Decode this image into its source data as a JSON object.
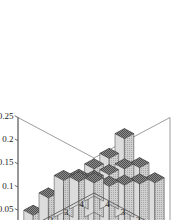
{
  "figure": {
    "background_color": "#ffffff",
    "axis_color": "#4a4a4a",
    "box_color": "#5a5a5a",
    "bar_top_color": "#6e6e6e",
    "bar_left_color": "#d8d8d8",
    "bar_right_color": "#bdbdbd",
    "bar_edge_color": "#2b2b2b"
  },
  "chart_data": {
    "type": "bar",
    "subtype": "bar3d",
    "title": "",
    "xlabel": "",
    "ylabel": "",
    "zlabel": "",
    "grid": false,
    "legend": false,
    "x_categories": [
      "0",
      "1",
      "2",
      "3",
      "4"
    ],
    "y_categories": [
      "0",
      "1",
      "2",
      "3",
      "4"
    ],
    "x_tick_labels": [
      "0",
      "1",
      "2",
      "3",
      "4"
    ],
    "y_tick_labels": [
      "0",
      "1",
      "2",
      "3",
      "4"
    ],
    "z_tick_labels": [
      "0",
      "0.05",
      "0.1",
      "0.15",
      "0.2",
      "0.25"
    ],
    "z_tick_values": [
      0,
      0.05,
      0.1,
      0.15,
      0.2,
      0.25
    ],
    "zlim": [
      0,
      0.25
    ],
    "xlim": [
      0,
      4
    ],
    "ylim": [
      0,
      4
    ],
    "rows_note": "values[row][col] with row = y index 0..4 (back to front), col = x index 0..4 (left to right)",
    "values": [
      [
        0.12,
        0.17,
        0.25,
        0.17,
        0.12
      ],
      [
        0.1,
        0.15,
        0.19,
        0.15,
        0.1
      ],
      [
        0.08,
        0.12,
        0.15,
        0.12,
        0.08
      ],
      [
        0.06,
        0.09,
        0.11,
        0.09,
        0.06
      ],
      [
        0.05,
        0.07,
        0.09,
        0.07,
        0.05
      ]
    ],
    "series": [
      {
        "name": "row-0",
        "values": [
          0.12,
          0.17,
          0.25,
          0.17,
          0.12
        ]
      },
      {
        "name": "row-1",
        "values": [
          0.1,
          0.15,
          0.19,
          0.15,
          0.1
        ]
      },
      {
        "name": "row-2",
        "values": [
          0.08,
          0.12,
          0.15,
          0.12,
          0.08
        ]
      },
      {
        "name": "row-3",
        "values": [
          0.06,
          0.09,
          0.11,
          0.09,
          0.06
        ]
      },
      {
        "name": "row-4",
        "values": [
          0.05,
          0.07,
          0.09,
          0.07,
          0.05
        ]
      }
    ]
  }
}
